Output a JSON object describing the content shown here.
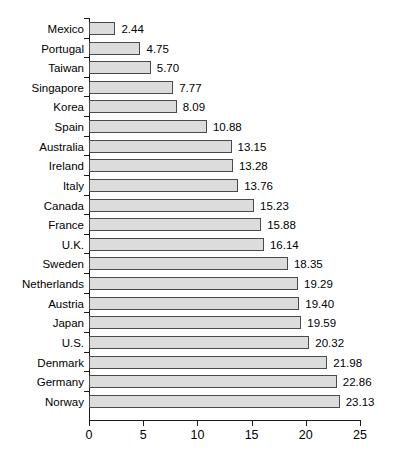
{
  "chart_data": {
    "type": "bar",
    "orientation": "horizontal",
    "title": "",
    "subtitle": "",
    "xlabel": "",
    "ylabel": "",
    "xlim": [
      0,
      25
    ],
    "grid": false,
    "legend": null,
    "categories": [
      "Mexico",
      "Portugal",
      "Taiwan",
      "Singapore",
      "Korea",
      "Spain",
      "Australia",
      "Ireland",
      "Italy",
      "Canada",
      "France",
      "U.K.",
      "Sweden",
      "Netherlands",
      "Austria",
      "Japan",
      "U.S.",
      "Denmark",
      "Germany",
      "Norway"
    ],
    "values": [
      2.44,
      4.75,
      5.7,
      7.77,
      8.09,
      10.88,
      13.15,
      13.28,
      13.76,
      15.23,
      15.88,
      16.14,
      18.35,
      19.29,
      19.4,
      19.59,
      20.32,
      21.98,
      22.86,
      23.13
    ],
    "value_labels": [
      "2.44",
      "4.75",
      "5.70",
      "7.77",
      "8.09",
      "10.88",
      "13.15",
      "13.28",
      "13.76",
      "15.23",
      "15.88",
      "16.14",
      "18.35",
      "19.29",
      "19.40",
      "19.59",
      "20.32",
      "21.98",
      "22.86",
      "23.13"
    ],
    "x_ticks": [
      0,
      5,
      10,
      15,
      20,
      25
    ],
    "x_tick_labels": [
      "0",
      "5",
      "10",
      "15",
      "20",
      "25"
    ],
    "colors": {
      "bar_fill": "#dcdcdc",
      "bar_border": "#4a4a4a",
      "axis": "#1a1a1a",
      "text": "#000000",
      "background": "#ffffff"
    }
  }
}
